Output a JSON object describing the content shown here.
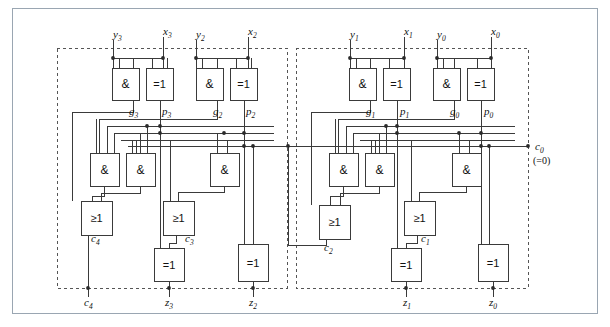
{
  "figure": {
    "frame_color": "#9aa6b2",
    "wire_color": "#3a3a3a",
    "dash_color": "#555555"
  },
  "inputs": [
    {
      "name": "y3",
      "base": "y",
      "sub": "3",
      "x": 113,
      "y": 29
    },
    {
      "name": "x3",
      "base": "x",
      "sub": "3",
      "x": 163,
      "y": 26
    },
    {
      "name": "y2",
      "base": "y",
      "sub": "2",
      "x": 196,
      "y": 29
    },
    {
      "name": "x2",
      "base": "x",
      "sub": "2",
      "x": 248,
      "y": 26
    },
    {
      "name": "y1",
      "base": "y",
      "sub": "1",
      "x": 350,
      "y": 29
    },
    {
      "name": "x1",
      "base": "x",
      "sub": "1",
      "x": 404,
      "y": 26
    },
    {
      "name": "y0",
      "base": "y",
      "sub": "0",
      "x": 437,
      "y": 29
    },
    {
      "name": "x0",
      "base": "x",
      "sub": "0",
      "x": 491,
      "y": 26
    }
  ],
  "outputs": [
    {
      "name": "c4",
      "base": "c",
      "sub": "4",
      "x": 84,
      "y": 297
    },
    {
      "name": "z3",
      "base": "z",
      "sub": "3",
      "x": 165,
      "y": 297
    },
    {
      "name": "z2",
      "base": "z",
      "sub": "2",
      "x": 249,
      "y": 297
    },
    {
      "name": "z1",
      "base": "z",
      "sub": "1",
      "x": 403,
      "y": 297
    },
    {
      "name": "z0",
      "base": "z",
      "sub": "0",
      "x": 489,
      "y": 297
    }
  ],
  "carry_in": {
    "name": "c0",
    "base": "c",
    "sub": "0",
    "value_label": "(=0)",
    "x": 535,
    "y": 141,
    "value_x": 533,
    "value_y": 156
  },
  "signal_labels": [
    {
      "name": "g3",
      "base": "g",
      "sub": "3",
      "x": 129,
      "y": 106
    },
    {
      "name": "p3",
      "base": "p",
      "sub": "3",
      "x": 162,
      "y": 106
    },
    {
      "name": "g2",
      "base": "g",
      "sub": "2",
      "x": 213,
      "y": 106
    },
    {
      "name": "p2",
      "base": "p",
      "sub": "2",
      "x": 246,
      "y": 106
    },
    {
      "name": "g1",
      "base": "g",
      "sub": "1",
      "x": 366,
      "y": 106
    },
    {
      "name": "p1",
      "base": "p",
      "sub": "1",
      "x": 400,
      "y": 106
    },
    {
      "name": "g0",
      "base": "g",
      "sub": "0",
      "x": 450,
      "y": 106
    },
    {
      "name": "p0",
      "base": "p",
      "sub": "0",
      "x": 484,
      "y": 106
    },
    {
      "name": "c4i",
      "base": "c",
      "sub": "4",
      "x": 91,
      "y": 233
    },
    {
      "name": "c3i",
      "base": "c",
      "sub": "3",
      "x": 185,
      "y": 233
    },
    {
      "name": "c2i",
      "base": "c",
      "sub": "2",
      "x": 324,
      "y": 242
    },
    {
      "name": "c1i",
      "base": "c",
      "sub": "1",
      "x": 421,
      "y": 233
    }
  ],
  "gates": [
    {
      "id": "and-g3",
      "type": "AND",
      "symbol": "&",
      "x": 112,
      "y": 68,
      "w": 27,
      "h": 32
    },
    {
      "id": "xor-p3",
      "type": "XOR",
      "symbol": "=1",
      "x": 146,
      "y": 68,
      "w": 27,
      "h": 32
    },
    {
      "id": "and-g2",
      "type": "AND",
      "symbol": "&",
      "x": 196,
      "y": 68,
      "w": 27,
      "h": 32
    },
    {
      "id": "xor-p2",
      "type": "XOR",
      "symbol": "=1",
      "x": 230,
      "y": 68,
      "w": 27,
      "h": 32
    },
    {
      "id": "and-g1",
      "type": "AND",
      "symbol": "&",
      "x": 349,
      "y": 68,
      "w": 27,
      "h": 32
    },
    {
      "id": "xor-p1",
      "type": "XOR",
      "symbol": "=1",
      "x": 383,
      "y": 68,
      "w": 27,
      "h": 32
    },
    {
      "id": "and-g0",
      "type": "AND",
      "symbol": "&",
      "x": 433,
      "y": 68,
      "w": 27,
      "h": 32
    },
    {
      "id": "xor-p0",
      "type": "XOR",
      "symbol": "=1",
      "x": 467,
      "y": 68,
      "w": 27,
      "h": 32
    },
    {
      "id": "and-c4a",
      "type": "AND",
      "symbol": "&",
      "x": 90,
      "y": 153,
      "w": 29,
      "h": 33
    },
    {
      "id": "and-c4b",
      "type": "AND",
      "symbol": "&",
      "x": 126,
      "y": 153,
      "w": 29,
      "h": 33
    },
    {
      "id": "and-c3",
      "type": "AND",
      "symbol": "&",
      "x": 210,
      "y": 153,
      "w": 29,
      "h": 33
    },
    {
      "id": "and-c2a",
      "type": "AND",
      "symbol": "&",
      "x": 329,
      "y": 153,
      "w": 29,
      "h": 33
    },
    {
      "id": "and-c2b",
      "type": "AND",
      "symbol": "&",
      "x": 365,
      "y": 153,
      "w": 29,
      "h": 33
    },
    {
      "id": "and-c1",
      "type": "AND",
      "symbol": "&",
      "x": 452,
      "y": 153,
      "w": 29,
      "h": 33
    },
    {
      "id": "or-c4",
      "type": "OR",
      "symbol": "≥1",
      "x": 81,
      "y": 201,
      "w": 31,
      "h": 34
    },
    {
      "id": "or-c3",
      "type": "OR",
      "symbol": "≥1",
      "x": 163,
      "y": 201,
      "w": 31,
      "h": 34
    },
    {
      "id": "or-c2",
      "type": "OR",
      "symbol": "≥1",
      "x": 319,
      "y": 205,
      "w": 31,
      "h": 34
    },
    {
      "id": "or-c1",
      "type": "OR",
      "symbol": "≥1",
      "x": 404,
      "y": 201,
      "w": 31,
      "h": 34
    },
    {
      "id": "xor-z3",
      "type": "XOR",
      "symbol": "=1",
      "x": 154,
      "y": 248,
      "w": 30,
      "h": 33
    },
    {
      "id": "xor-z2",
      "type": "XOR",
      "symbol": "=1",
      "x": 238,
      "y": 244,
      "w": 30,
      "h": 37
    },
    {
      "id": "xor-z1",
      "type": "XOR",
      "symbol": "=1",
      "x": 391,
      "y": 248,
      "w": 30,
      "h": 33
    },
    {
      "id": "xor-z0",
      "type": "XOR",
      "symbol": "=1",
      "x": 478,
      "y": 244,
      "w": 30,
      "h": 37
    }
  ],
  "blocks": [
    {
      "id": "block-high",
      "label": "bits 3-2 carry-lookahead block",
      "x": 57,
      "y": 48,
      "w": 230,
      "h": 240
    },
    {
      "id": "block-low",
      "label": "bits 1-0 carry-lookahead block",
      "x": 296,
      "y": 48,
      "w": 232,
      "h": 240
    }
  ]
}
